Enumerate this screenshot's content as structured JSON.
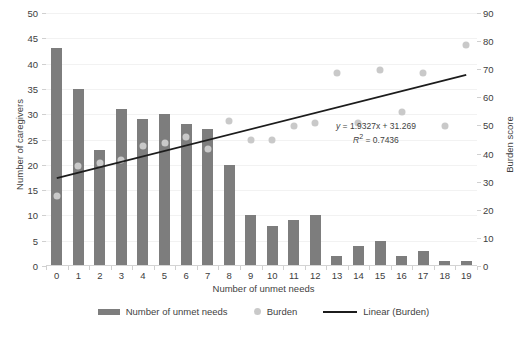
{
  "chart_data": {
    "type": "bar",
    "title": "",
    "xlabel": "Number of unmet needs",
    "ylabel": "Number of caregivers",
    "y2label": "Burden score",
    "categories": [
      0,
      1,
      2,
      3,
      4,
      5,
      6,
      7,
      8,
      9,
      10,
      11,
      12,
      13,
      14,
      15,
      16,
      17,
      18,
      19
    ],
    "xlim": [
      -0.5,
      19.5
    ],
    "ylim": [
      0,
      50
    ],
    "y2lim": [
      0,
      90
    ],
    "yticks": [
      0,
      5,
      10,
      15,
      20,
      25,
      30,
      35,
      40,
      45,
      50
    ],
    "y2ticks": [
      0,
      10,
      20,
      30,
      40,
      50,
      60,
      70,
      80,
      90
    ],
    "grid": true,
    "legend_position": "bottom",
    "series": [
      {
        "name": "Number of unmet needs",
        "type": "bar",
        "axis": "left",
        "color": "#7d7d7d",
        "values": [
          43,
          35,
          23,
          31,
          29,
          30,
          28,
          27,
          20,
          10,
          8,
          9,
          10,
          2,
          4,
          5,
          2,
          3,
          1,
          1
        ]
      },
      {
        "name": "Burden",
        "type": "scatter",
        "axis": "right",
        "color": "#c9c9c9",
        "values": [
          26,
          37,
          38,
          39,
          44,
          45,
          47,
          43,
          53,
          46,
          46,
          51,
          52,
          70,
          52,
          71,
          56,
          70,
          51,
          80
        ]
      },
      {
        "name": "Linear (Burden)",
        "type": "line",
        "axis": "right",
        "color": "#1c1c1c",
        "slope": 1.9327,
        "intercept": 31.269,
        "r_squared": 0.7436
      }
    ],
    "annotations": {
      "equation": "y = 1.9327x + 31.269",
      "r_squared_text": "R2 = 0.7436",
      "equation_prefix": "y",
      "equation_body": " = 1.9327x + 31.269",
      "r2_prefix": "R",
      "r2_sup": "2",
      "r2_body": " = 0.7436"
    }
  },
  "legend": {
    "items": [
      {
        "label": "Number of unmet needs",
        "marker": "bar-swatch"
      },
      {
        "label": "Burden",
        "marker": "dot-swatch"
      },
      {
        "label": "Linear (Burden)",
        "marker": "line-swatch"
      }
    ]
  },
  "colors": {
    "bar": "#7d7d7d",
    "dot": "#c9c9c9",
    "trend": "#1c1c1c",
    "grid": "#f2f2f2",
    "axis": "#d4d4d4",
    "text": "#3f3f3f"
  }
}
